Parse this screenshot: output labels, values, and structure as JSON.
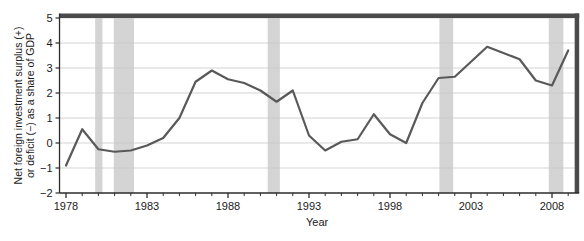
{
  "chart_data": {
    "type": "line",
    "title": "",
    "xlabel": "Year",
    "ylabel": "Net foreign investment surplus (+) or deficit (−) as a share of GDP",
    "ylabel_line1": "Net foreign investment surplus (+)",
    "ylabel_line2": "or deficit (−) as a share of GDP",
    "xlim": [
      1977.6,
      2009.4
    ],
    "ylim": [
      -2,
      5
    ],
    "xticks": [
      1978,
      1983,
      1988,
      1993,
      1998,
      2003,
      2008
    ],
    "xtick_labels": [
      "1978",
      "1983",
      "1988",
      "1993",
      "1998",
      "2003",
      "2008"
    ],
    "xminorticks": [
      1979,
      1980,
      1981,
      1982,
      1984,
      1985,
      1986,
      1987,
      1989,
      1990,
      1991,
      1992,
      1994,
      1995,
      1996,
      1997,
      1999,
      2000,
      2001,
      2002,
      2004,
      2005,
      2006,
      2007,
      2009
    ],
    "yticks": [
      -2,
      -1,
      0,
      1,
      2,
      3,
      4,
      5
    ],
    "ytick_labels": [
      "−2",
      "−1",
      "0",
      "1",
      "2",
      "3",
      "4",
      "5"
    ],
    "grid": "horizontal",
    "legend": "none",
    "series_color": "#595959",
    "band_color": "#d4d4d4",
    "x": [
      1978,
      1979,
      1980,
      1981,
      1982,
      1983,
      1984,
      1985,
      1986,
      1987,
      1988,
      1989,
      1990,
      1991,
      1992,
      1993,
      1994,
      1995,
      1996,
      1997,
      1998,
      1999,
      2000,
      2001,
      2002,
      2003,
      2004,
      2005,
      2006,
      2007,
      2008,
      2009
    ],
    "series": [
      {
        "name": "Net foreign investment as share of GDP",
        "values": [
          -0.9,
          0.55,
          -0.25,
          -0.35,
          -0.3,
          -0.1,
          0.2,
          1.0,
          2.45,
          2.9,
          2.55,
          2.4,
          2.1,
          1.65,
          2.1,
          0.3,
          -0.3,
          0.05,
          0.15,
          1.15,
          0.35,
          0.0,
          1.6,
          2.6,
          2.65,
          3.25,
          3.85,
          3.6,
          3.35,
          2.5,
          2.3,
          3.7
        ]
      }
    ],
    "recession_bands": [
      {
        "start": 1979.8,
        "end": 1980.25,
        "label": "1980 recession"
      },
      {
        "start": 1980.95,
        "end": 1982.2,
        "label": "1981-82 recession"
      },
      {
        "start": 1990.45,
        "end": 1991.2,
        "label": "1990-91 recession"
      },
      {
        "start": 2001.05,
        "end": 2001.9,
        "label": "2001 recession"
      },
      {
        "start": 2007.8,
        "end": 2008.7,
        "label": "2007-09 recession"
      }
    ]
  }
}
